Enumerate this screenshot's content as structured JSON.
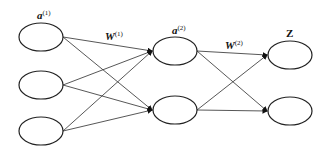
{
  "diagram": {
    "type": "neural-network",
    "layers": [
      {
        "name": "input",
        "label": "a",
        "superscript": "(1)",
        "node_count": 3
      },
      {
        "name": "hidden",
        "label": "a",
        "superscript": "(2)",
        "node_count": 2
      },
      {
        "name": "output",
        "label": "Z",
        "superscript": "",
        "node_count": 2
      }
    ],
    "weights": [
      {
        "label": "W",
        "superscript": "(1)",
        "from": "input",
        "to": "hidden"
      },
      {
        "label": "W",
        "superscript": "(2)",
        "from": "hidden",
        "to": "output"
      }
    ],
    "colors": {
      "stroke": "#222222",
      "background": "#ffffff"
    }
  }
}
